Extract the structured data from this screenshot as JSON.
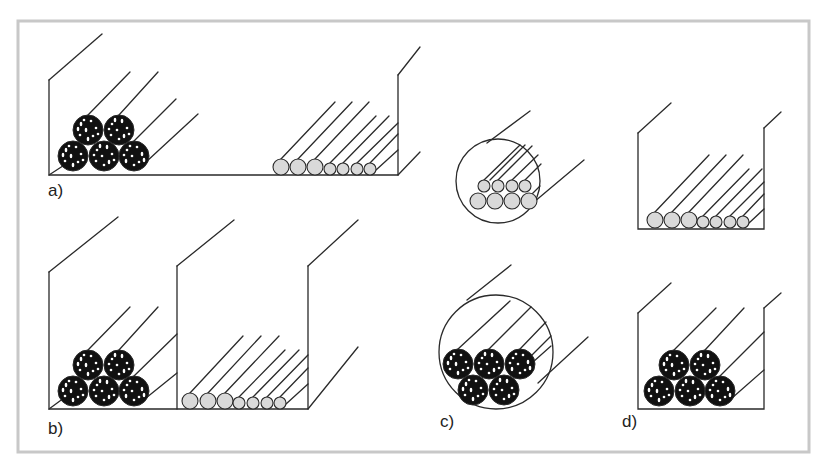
{
  "figure": {
    "labels": [
      {
        "id": "a",
        "text": "a)",
        "x": 48,
        "y": 196
      },
      {
        "id": "b",
        "text": "b)",
        "x": 48,
        "y": 434
      },
      {
        "id": "c",
        "text": "c)",
        "x": 440,
        "y": 427
      },
      {
        "id": "d",
        "text": "d)",
        "x": 622,
        "y": 427
      }
    ],
    "colors": {
      "frame": "#c8c8c8",
      "line": "#2a2a2a",
      "light_cable_fill": "#d9d9d9",
      "dark_cable_fill": "#111111",
      "background": "#ffffff"
    },
    "panels": [
      {
        "id": "a",
        "description": "Single tray: bundled power cables and separated control cables",
        "tray": {
          "left": 49,
          "right": 398,
          "bottom": 175,
          "top_left": 80,
          "top_right": 75,
          "depth_dx": 54,
          "depth_dy": -46
        },
        "dark_cables": [
          {
            "cx": 73,
            "cy": 156,
            "r": 15
          },
          {
            "cx": 104,
            "cy": 156,
            "r": 15
          },
          {
            "cx": 134,
            "cy": 156,
            "r": 15
          },
          {
            "cx": 88,
            "cy": 130,
            "r": 15
          },
          {
            "cx": 119,
            "cy": 130,
            "r": 15
          }
        ],
        "light_cables": [
          {
            "cx": 281,
            "cy": 167,
            "r": 8
          },
          {
            "cx": 298,
            "cy": 167,
            "r": 8
          },
          {
            "cx": 315,
            "cy": 167,
            "r": 8
          },
          {
            "cx": 330,
            "cy": 169,
            "r": 6
          },
          {
            "cx": 343,
            "cy": 169,
            "r": 6
          },
          {
            "cx": 357,
            "cy": 169,
            "r": 6
          },
          {
            "cx": 370,
            "cy": 169,
            "r": 6
          }
        ]
      },
      {
        "id": "b",
        "description": "Two adjacent trays separated by a divider",
        "tray": {
          "left": 49,
          "mid": 177,
          "right": 308,
          "bottom": 409,
          "top": 272
        },
        "dark_cables": [
          {
            "cx": 73,
            "cy": 391,
            "r": 15
          },
          {
            "cx": 104,
            "cy": 391,
            "r": 15
          },
          {
            "cx": 134,
            "cy": 391,
            "r": 15
          },
          {
            "cx": 88,
            "cy": 365,
            "r": 15
          },
          {
            "cx": 119,
            "cy": 365,
            "r": 15
          }
        ],
        "light_cables": [
          {
            "cx": 190,
            "cy": 401,
            "r": 8
          },
          {
            "cx": 208,
            "cy": 401,
            "r": 8
          },
          {
            "cx": 225,
            "cy": 401,
            "r": 8
          },
          {
            "cx": 239,
            "cy": 403,
            "r": 6
          },
          {
            "cx": 253,
            "cy": 403,
            "r": 6
          },
          {
            "cx": 267,
            "cy": 403,
            "r": 6
          },
          {
            "cx": 280,
            "cy": 403,
            "r": 6
          }
        ]
      },
      {
        "id": "c",
        "description": "Cables inside circular conduits",
        "conduits": [
          {
            "cx": 498,
            "cy": 181,
            "r": 42,
            "kind": "light"
          },
          {
            "cx": 496,
            "cy": 352,
            "r": 57,
            "kind": "dark"
          }
        ],
        "light_cables": [
          {
            "cx": 484,
            "cy": 186,
            "r": 6
          },
          {
            "cx": 498,
            "cy": 186,
            "r": 6
          },
          {
            "cx": 512,
            "cy": 186,
            "r": 6
          },
          {
            "cx": 525,
            "cy": 186,
            "r": 6
          },
          {
            "cx": 478,
            "cy": 201,
            "r": 8
          },
          {
            "cx": 495,
            "cy": 201,
            "r": 8
          },
          {
            "cx": 512,
            "cy": 201,
            "r": 8
          },
          {
            "cx": 529,
            "cy": 201,
            "r": 8
          }
        ],
        "dark_cables": [
          {
            "cx": 458,
            "cy": 364,
            "r": 15
          },
          {
            "cx": 489,
            "cy": 364,
            "r": 15
          },
          {
            "cx": 520,
            "cy": 364,
            "r": 15
          },
          {
            "cx": 473,
            "cy": 390,
            "r": 15
          },
          {
            "cx": 504,
            "cy": 390,
            "r": 15
          }
        ]
      },
      {
        "id": "d",
        "description": "Separate narrow trays stacked vertically",
        "trays": [
          {
            "left": 638,
            "right": 764,
            "bottom": 229,
            "top_left": 133,
            "top_right": 128,
            "kind": "light"
          },
          {
            "left": 638,
            "right": 764,
            "bottom": 409,
            "top_left": 313,
            "top_right": 308,
            "kind": "dark"
          }
        ],
        "light_cables": [
          {
            "cx": 655,
            "cy": 220,
            "r": 8
          },
          {
            "cx": 672,
            "cy": 220,
            "r": 8
          },
          {
            "cx": 689,
            "cy": 220,
            "r": 8
          },
          {
            "cx": 703,
            "cy": 222,
            "r": 6
          },
          {
            "cx": 716,
            "cy": 222,
            "r": 6
          },
          {
            "cx": 730,
            "cy": 222,
            "r": 6
          },
          {
            "cx": 743,
            "cy": 222,
            "r": 6
          }
        ],
        "dark_cables": [
          {
            "cx": 659,
            "cy": 391,
            "r": 15
          },
          {
            "cx": 690,
            "cy": 391,
            "r": 15
          },
          {
            "cx": 720,
            "cy": 391,
            "r": 15
          },
          {
            "cx": 674,
            "cy": 365,
            "r": 15
          },
          {
            "cx": 705,
            "cy": 365,
            "r": 15
          }
        ]
      }
    ]
  }
}
